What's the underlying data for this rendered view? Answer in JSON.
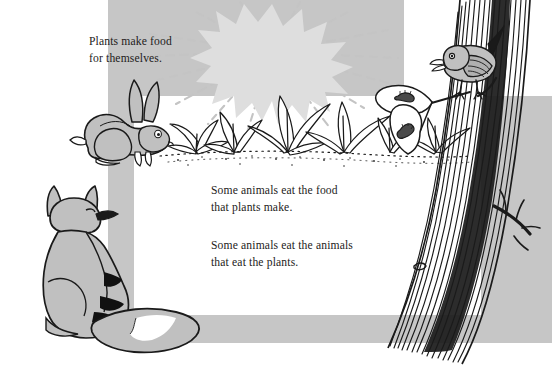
{
  "page": {
    "width": 552,
    "height": 385,
    "background_color": "#ffffff"
  },
  "colors": {
    "panel_gray": "#c6c6c6",
    "animal_gray": "#c0c0c0",
    "sun_gray": "#dedede",
    "ray_gray": "#c4c4c4",
    "ink_black": "#1a1a1a",
    "text_color": "#1d1b1a",
    "white": "#ffffff"
  },
  "captions": {
    "plants": "Plants make food\nfor themselves.",
    "herbivores": "Some animals eat the food\nthat plants make.",
    "carnivores": "Some animals eat the animals\nthat eat the plants."
  },
  "illustration": {
    "sun": {
      "name": "sun-starburst",
      "label": "Sun",
      "fill": "#dedede",
      "center_x": 272,
      "center_y": 52,
      "radius": 48,
      "ray_count": 14,
      "ray_style": "dashed"
    },
    "plants": {
      "name": "plant-row",
      "label": "Plants",
      "fill": "#ffffff",
      "outline": "#1a1a1a",
      "ground_line_style": "dotted",
      "ground_y": 152,
      "clump_count": 6
    },
    "rabbit": {
      "name": "rabbit",
      "label": "Rabbit",
      "fill": "#c0c0c0",
      "outline": "#1a1a1a",
      "facing": "right",
      "x": 68,
      "y": 96,
      "width": 110,
      "height": 70
    },
    "fox": {
      "name": "fox",
      "label": "Fox",
      "fill": "#c0c0c0",
      "outline": "#1a1a1a",
      "facing": "right",
      "x": 24,
      "y": 185,
      "width": 180,
      "height": 170,
      "accent_fill": "#111111",
      "tail_tip_fill": "#ffffff"
    },
    "bird": {
      "name": "bird",
      "label": "Bird",
      "fill": "#c0c0c0",
      "outline": "#1a1a1a",
      "facing": "left",
      "x": 432,
      "y": 38,
      "width": 70,
      "height": 52
    },
    "caterpillars": {
      "name": "caterpillars",
      "label": "Caterpillars",
      "fill": "#4a4a4a",
      "count": 2
    },
    "tree": {
      "name": "tree-trunk",
      "label": "Tree",
      "outline": "#1a1a1a",
      "bark_line_count": 18,
      "branch_count": 3
    },
    "panel": {
      "name": "gray-frame",
      "label": "Gray background frame",
      "fill": "#c6c6c6",
      "segments": [
        {
          "name": "top-band",
          "x": 108,
          "y": 0,
          "width": 444,
          "height": 96
        },
        {
          "name": "left-band",
          "x": 108,
          "y": 96,
          "width": 26,
          "height": 219
        },
        {
          "name": "bottom-band",
          "x": 108,
          "y": 315,
          "width": 399,
          "height": 28
        },
        {
          "name": "right-band",
          "x": 481,
          "y": 96,
          "width": 26,
          "height": 219
        }
      ]
    }
  }
}
